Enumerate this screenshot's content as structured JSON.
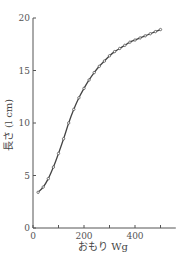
{
  "chart_data": {
    "type": "line",
    "title": "",
    "xlabel": "おもり Wg",
    "ylabel": "長さ (l cm)",
    "xlim": [
      0,
      560
    ],
    "ylim": [
      0,
      20
    ],
    "x_ticks": [
      0,
      100,
      200,
      300,
      400,
      500
    ],
    "x_tick_labels": [
      "0",
      "",
      "200",
      "",
      "400",
      ""
    ],
    "y_ticks": [
      0,
      5,
      10,
      15,
      20
    ],
    "y_tick_labels": [
      "0",
      "5",
      "10",
      "15",
      "20"
    ],
    "grid": false,
    "legend": null,
    "series": [
      {
        "name": "長さ",
        "marker": "dot",
        "x": [
          20,
          40,
          60,
          80,
          100,
          120,
          140,
          160,
          180,
          200,
          220,
          240,
          260,
          280,
          300,
          320,
          340,
          360,
          380,
          400,
          420,
          440,
          460,
          480,
          500
        ],
        "y": [
          3.4,
          3.9,
          4.7,
          5.8,
          7.1,
          8.5,
          10.0,
          11.3,
          12.4,
          13.3,
          14.1,
          14.8,
          15.4,
          15.9,
          16.4,
          16.8,
          17.1,
          17.4,
          17.7,
          17.9,
          18.1,
          18.3,
          18.5,
          18.7,
          18.9
        ]
      }
    ]
  },
  "colors": {
    "axis": "#555555",
    "line": "#444444"
  }
}
